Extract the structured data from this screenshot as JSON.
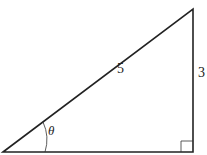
{
  "diagram": {
    "type": "right-triangle",
    "labels": {
      "hypotenuse": "5",
      "opposite": "3",
      "angle": "θ"
    },
    "colors": {
      "stroke": "#222222",
      "background": "#ffffff"
    }
  }
}
